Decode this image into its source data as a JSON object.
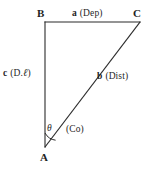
{
  "figure": {
    "type": "right-triangle-diagram",
    "background_color": "#ffffff",
    "stroke_color": "#2b2b2b",
    "vertices": {
      "a": {
        "name": "A",
        "label": "A",
        "x": 45,
        "y": 147
      },
      "b": {
        "name": "B",
        "label": "B",
        "x": 45,
        "y": 22
      },
      "c": {
        "name": "C",
        "label": "C",
        "x": 140,
        "y": 22
      }
    },
    "sides": [
      {
        "id": "side-a",
        "symbol": "a",
        "annotation": "(Dep)",
        "full_label": "a (Dep)",
        "from": "B",
        "to": "C",
        "orientation": "horizontal-top"
      },
      {
        "id": "side-b",
        "symbol": "b",
        "annotation": "(Dist)",
        "full_label": "b (Dist)",
        "from": "A",
        "to": "C",
        "orientation": "hypotenuse"
      },
      {
        "id": "side-c",
        "symbol": "c",
        "annotation": "(D.ℓ)",
        "annotation_prefix": "(D.",
        "annotation_script": "ℓ",
        "annotation_suffix": ")",
        "full_label": "c (D.ℓ)",
        "from": "A",
        "to": "B",
        "orientation": "vertical-left"
      }
    ],
    "angle": {
      "id": "angle-theta",
      "symbol": "θ",
      "annotation": "(Co)",
      "at_vertex": "A",
      "arc_radius": 14
    }
  }
}
